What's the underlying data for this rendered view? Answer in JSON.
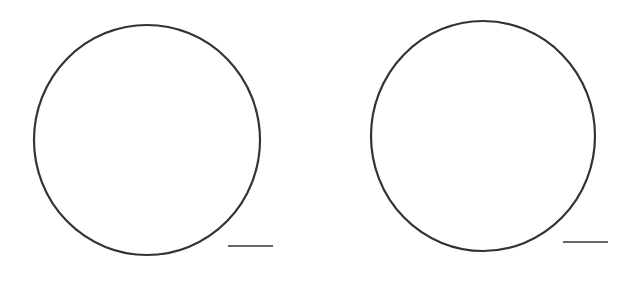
{
  "diagram": {
    "background": "#ffffff",
    "stroke_color": "#333333",
    "figures": [
      {
        "name": "left-circle",
        "shape": "circle",
        "cx": 147,
        "cy": 140,
        "rx": 113,
        "ry": 115,
        "stroke_width": 2.2,
        "scale_bar": {
          "x1": 228,
          "y1": 246,
          "x2": 273,
          "y2": 246,
          "stroke_width": 1.6
        }
      },
      {
        "name": "right-circle",
        "shape": "circle",
        "cx": 483,
        "cy": 136,
        "rx": 112,
        "ry": 115,
        "stroke_width": 2.2,
        "scale_bar": {
          "x1": 563,
          "y1": 242,
          "x2": 608,
          "y2": 242,
          "stroke_width": 1.6
        }
      }
    ]
  }
}
